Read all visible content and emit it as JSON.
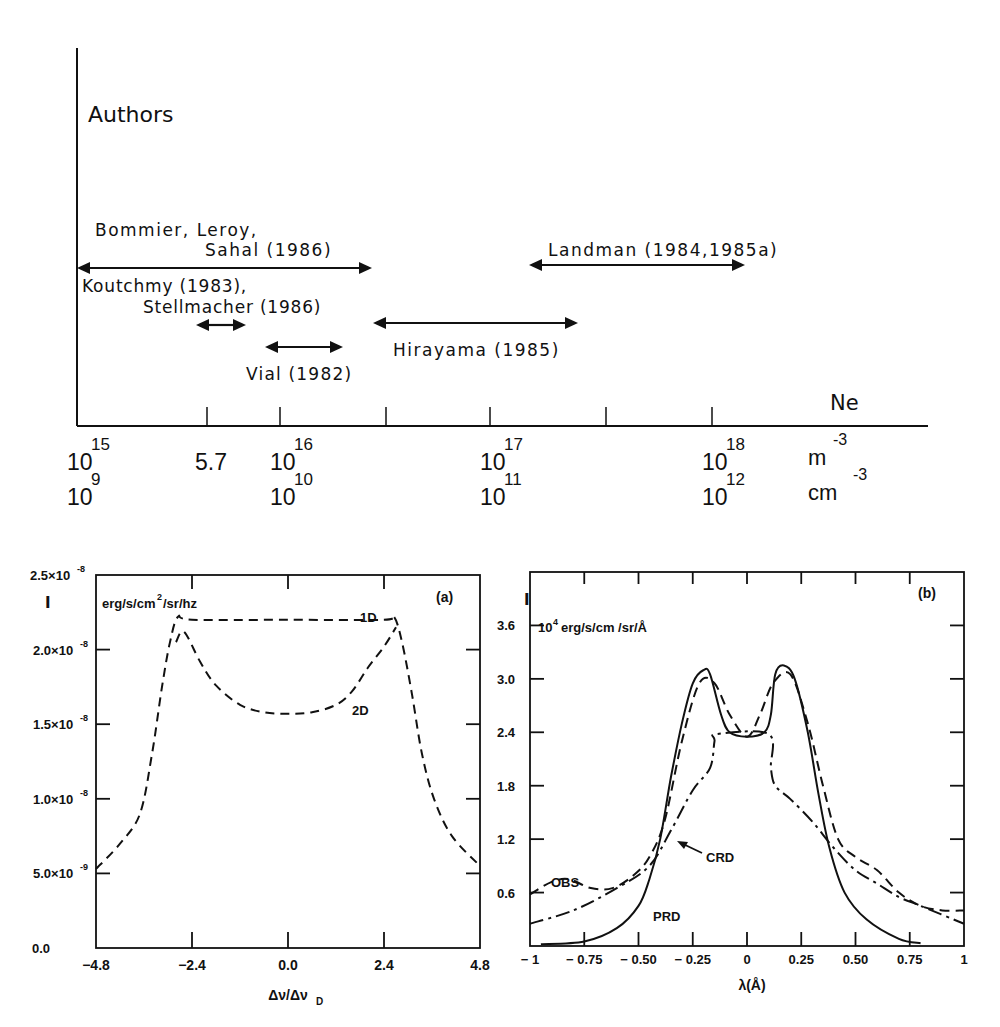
{
  "top_figure": {
    "y_axis_label": "Authors",
    "x_axis_label": "Ne",
    "units_m": "m",
    "units_cm": "cm",
    "units_exp": "-3",
    "ticks_m": [
      {
        "base": "10",
        "exp": "15",
        "x": 77
      },
      {
        "base": "5.7",
        "exp": "",
        "x": 207
      },
      {
        "base": "10",
        "exp": "16",
        "x": 280
      },
      {
        "base": "10",
        "exp": "17",
        "x": 490
      },
      {
        "base": "10",
        "exp": "18",
        "x": 712
      }
    ],
    "ticks_cm": [
      {
        "base": "10",
        "exp": "9",
        "x": 77
      },
      {
        "base": "10",
        "exp": "10",
        "x": 280
      },
      {
        "base": "10",
        "exp": "11",
        "x": 490
      },
      {
        "base": "10",
        "exp": "12",
        "x": 712
      }
    ],
    "authors": [
      {
        "line1": "Bommier, Leroy,",
        "line2": "Sahal (1986)",
        "range_log_m": [
          15.0,
          16.48
        ]
      },
      {
        "line1": "Koutchmy (1983),",
        "line2": "Stellmacher (1986)",
        "range_log_m": [
          15.58,
          15.82
        ]
      },
      {
        "line1": "Vial (1982)",
        "line2": "",
        "range_log_m": [
          15.84,
          16.3
        ]
      },
      {
        "line1": "Hirayama (1985)",
        "line2": "",
        "range_log_m": [
          16.48,
          17.42
        ]
      },
      {
        "line1": "Landman (1984,1985a)",
        "line2": "",
        "range_log_m": [
          17.18,
          18.16
        ]
      }
    ]
  },
  "chart_data": [
    {
      "type": "line",
      "panel": "(a)",
      "title": "",
      "xlabel": "Δν/Δν_D",
      "ylabel": "I",
      "units": "erg/s/cm²/sr/hz",
      "xlim": [
        -4.8,
        4.8
      ],
      "ylim": [
        0.0,
        2.5e-08
      ],
      "x_ticks": [
        "-4.8",
        "-2.4",
        "0.0",
        "2.4",
        "4.8"
      ],
      "y_ticks": [
        "0.0",
        "5.0×10⁻⁹",
        "1.0×10⁻⁸",
        "1.5×10⁻⁸",
        "2.0×10⁻⁸",
        "2.5×10⁻⁸"
      ],
      "grid": false,
      "series": [
        {
          "name": "1D",
          "style": "dashed",
          "x": [
            -4.8,
            -4.2,
            -3.7,
            -3.4,
            -3.15,
            -2.95,
            -2.75,
            -2.4,
            0.0,
            2.4,
            2.65,
            2.85,
            3.1,
            3.35,
            3.65,
            4.1,
            4.8
          ],
          "y": [
            5.3e-09,
            7e-09,
            9e-09,
            1.3e-08,
            1.75e-08,
            2.05e-08,
            2.22e-08,
            2.2e-08,
            2.2e-08,
            2.2e-08,
            2.22e-08,
            2.05e-08,
            1.7e-08,
            1.3e-08,
            1e-08,
            7.5e-09,
            5.5e-09
          ]
        },
        {
          "name": "2D",
          "style": "dashed",
          "x": [
            -2.8,
            -2.6,
            -2.2,
            -1.8,
            -1.2,
            -0.6,
            0.0,
            0.6,
            1.2,
            1.6,
            2.0,
            2.4,
            2.7
          ],
          "y": [
            2.05e-08,
            2.12e-08,
            1.92e-08,
            1.76e-08,
            1.63e-08,
            1.58e-08,
            1.57e-08,
            1.58e-08,
            1.63e-08,
            1.72e-08,
            1.88e-08,
            2.02e-08,
            2.15e-08
          ]
        }
      ],
      "annotations": [
        "1D",
        "2D",
        "(a)"
      ]
    },
    {
      "type": "line",
      "panel": "(b)",
      "title": "",
      "xlabel": "λ(Å)",
      "ylabel": "I",
      "units": "10⁴ erg/s/cm /sr/Å",
      "xlim": [
        -1,
        1
      ],
      "ylim": [
        0.0,
        4.2
      ],
      "x_ticks": [
        "-1",
        "-0.75",
        "-0.50",
        "-0.25",
        "0",
        "0.25",
        "0.50",
        "0.75",
        "1"
      ],
      "y_ticks": [
        "0.6",
        "1.2",
        "1.8",
        "2.4",
        "3.0",
        "3.6"
      ],
      "grid": false,
      "series": [
        {
          "name": "PRD",
          "style": "solid",
          "x": [
            -0.95,
            -0.75,
            -0.6,
            -0.5,
            -0.45,
            -0.4,
            -0.35,
            -0.3,
            -0.25,
            -0.2,
            -0.17,
            -0.12,
            -0.08,
            0.0,
            0.08,
            0.11,
            0.13,
            0.17,
            0.22,
            0.28,
            0.33,
            0.38,
            0.45,
            0.55,
            0.7,
            0.8
          ],
          "y": [
            0.02,
            0.05,
            0.2,
            0.45,
            0.75,
            1.2,
            1.9,
            2.5,
            2.95,
            3.1,
            3.05,
            2.6,
            2.4,
            2.35,
            2.4,
            2.6,
            3.05,
            3.15,
            3.0,
            2.4,
            1.7,
            1.1,
            0.6,
            0.3,
            0.08,
            0.03
          ]
        },
        {
          "name": "OBS",
          "style": "dashed",
          "x": [
            -1.0,
            -0.9,
            -0.82,
            -0.72,
            -0.62,
            -0.52,
            -0.45,
            -0.38,
            -0.3,
            -0.22,
            -0.15,
            -0.08,
            0.0,
            0.06,
            0.12,
            0.2,
            0.28,
            0.35,
            0.42,
            0.5,
            0.6,
            0.7,
            0.8,
            0.9,
            1.0
          ],
          "y": [
            0.58,
            0.72,
            0.75,
            0.65,
            0.65,
            0.8,
            1.0,
            1.4,
            2.3,
            2.95,
            2.95,
            2.6,
            2.35,
            2.6,
            2.95,
            3.05,
            2.5,
            1.8,
            1.2,
            1.0,
            0.85,
            0.6,
            0.45,
            0.4,
            0.4
          ]
        },
        {
          "name": "CRD",
          "style": "dash-dot",
          "x": [
            -1.0,
            -0.8,
            -0.6,
            -0.45,
            -0.35,
            -0.25,
            -0.17,
            -0.15,
            -0.14,
            0.1,
            0.11,
            0.13,
            0.2,
            0.3,
            0.4,
            0.5,
            0.6,
            0.7,
            0.8,
            1.0
          ],
          "y": [
            0.25,
            0.4,
            0.65,
            0.9,
            1.3,
            1.75,
            2.0,
            2.3,
            2.38,
            2.38,
            2.0,
            1.8,
            1.65,
            1.4,
            1.1,
            0.85,
            0.7,
            0.55,
            0.45,
            0.25
          ]
        }
      ],
      "annotations": [
        "OBS",
        "CRD",
        "PRD",
        "(b)"
      ]
    }
  ]
}
